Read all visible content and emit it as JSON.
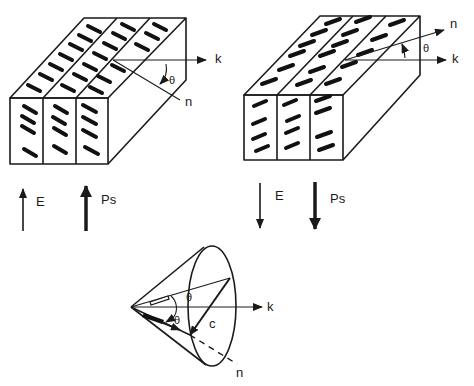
{
  "figure": {
    "panels": {
      "left": {
        "labels": {
          "k": "k",
          "n": "n",
          "theta": "θ"
        },
        "field_label": "E",
        "polarization_label": "Ps",
        "field_direction": "up",
        "polarization_direction": "up",
        "molecule_tilt": "down-right"
      },
      "right": {
        "labels": {
          "k": "k",
          "n": "n",
          "theta": "θ"
        },
        "field_label": "E",
        "polarization_label": "Ps",
        "field_direction": "down",
        "polarization_direction": "down",
        "molecule_tilt": "up-right"
      },
      "cone": {
        "labels": {
          "k": "k",
          "n": "n",
          "c": "c",
          "theta_outer": "θ",
          "theta_inner": "θ"
        }
      }
    },
    "colors": {
      "ink": "#1a1a1a",
      "background": "#ffffff"
    }
  }
}
